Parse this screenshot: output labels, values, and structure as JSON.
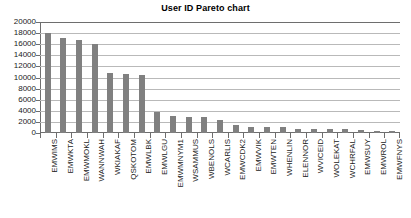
{
  "chart_data": {
    "type": "bar",
    "title": "User ID Pareto chart",
    "xlabel": "",
    "ylabel": "",
    "ylim": [
      0,
      20000
    ],
    "ytick_labels": [
      "0",
      "2000",
      "4000",
      "6000",
      "8000",
      "10000",
      "12000",
      "14000",
      "16000",
      "18000",
      "20000"
    ],
    "ytick_values": [
      0,
      2000,
      4000,
      6000,
      8000,
      10000,
      12000,
      14000,
      16000,
      18000,
      20000
    ],
    "grid": true,
    "legend": false,
    "bar_color": "#808080",
    "categories": [
      "EMWIMS",
      "EMWKTA",
      "EMWMOKL",
      "WANNWAH",
      "WKIAKAF",
      "QSKOTOM",
      "EMWLBK",
      "EMWLGU",
      "EMWMNYM1",
      "WSAMMUS",
      "WBENOLS",
      "WCARLIS",
      "EMWCDK2",
      "EMWVIK",
      "EMWTEN",
      "WHENLIN",
      "ELENNOR",
      "WVICEID",
      "WOLEKAT",
      "WCHRFAL",
      "EMWSUY",
      "EMWROL",
      "EMWFNYS"
    ],
    "values": [
      18000,
      17200,
      16700,
      16100,
      10800,
      10600,
      10500,
      3700,
      3000,
      2950,
      2900,
      2300,
      1500,
      1150,
      1050,
      1000,
      800,
      700,
      700,
      650,
      600,
      450,
      400
    ]
  }
}
